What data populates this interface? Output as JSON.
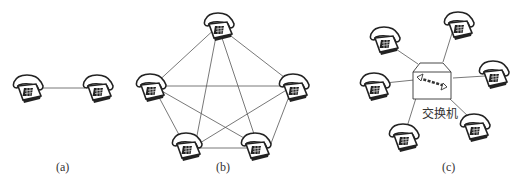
{
  "figure": {
    "panels": [
      {
        "id": "a",
        "caption": "(a)",
        "description": "Two telephones directly connected"
      },
      {
        "id": "b",
        "caption": "(b)",
        "description": "Five telephones fully meshed"
      },
      {
        "id": "c",
        "caption": "(c)",
        "description": "Six telephones connected via a switch",
        "switch_label": "交换机"
      }
    ]
  },
  "colors": {
    "line": "#555555",
    "phone": "#222222",
    "background": "#ffffff"
  }
}
